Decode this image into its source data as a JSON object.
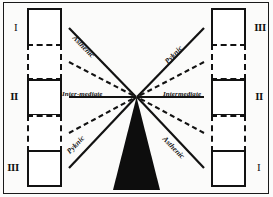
{
  "figure": {
    "colors": {
      "ink": "#121212",
      "background": "#ffffff",
      "wedge": "#0d0d0d"
    },
    "left_column": {
      "axis_label": "vertical-double-arrow",
      "nodes": [
        {
          "id": "L1",
          "numeral": "I",
          "numeral_style": "n1",
          "border": "solid",
          "arrow": "vertical-double-arrow"
        },
        {
          "id": "L2",
          "numeral": "",
          "numeral_style": "n1",
          "border": "dashed",
          "arrow": "vertical-double-arrow"
        },
        {
          "id": "L3",
          "numeral": "II",
          "numeral_style": "n2",
          "border": "solid",
          "arrow": "vertical-double-arrow"
        },
        {
          "id": "L4",
          "numeral": "",
          "numeral_style": "n1",
          "border": "dashed",
          "arrow": "vertical-double-arrow"
        },
        {
          "id": "L5",
          "numeral": "III",
          "numeral_style": "n3",
          "border": "solid",
          "arrow": "vertical-double-arrow"
        }
      ]
    },
    "right_column": {
      "axis_label": "horizontal-double-arrow",
      "nodes": [
        {
          "id": "R1",
          "numeral": "III",
          "numeral_style": "n3",
          "border": "solid",
          "arrow": "horizontal-double-arrow"
        },
        {
          "id": "R2",
          "numeral": "",
          "numeral_style": "n1",
          "border": "dashed",
          "arrow": "horizontal-double-arrow"
        },
        {
          "id": "R3",
          "numeral": "II",
          "numeral_style": "n2",
          "border": "solid",
          "arrow": "horizontal-double-arrow"
        },
        {
          "id": "R4",
          "numeral": "",
          "numeral_style": "n1",
          "border": "dashed",
          "arrow": "horizontal-double-arrow"
        },
        {
          "id": "R5",
          "numeral": "I",
          "numeral_style": "n1",
          "border": "solid",
          "arrow": "horizontal-double-arrow"
        }
      ]
    },
    "edge_labels": {
      "upper_left": "Asthenic",
      "upper_right": "Pyknic",
      "middle_left": "Inter-mediate",
      "middle_right": "Intermediate",
      "lower_left": "Pyknic",
      "lower_right": "Asthenic"
    },
    "center": {
      "wedge_name": "black-wedge",
      "convergence_point": "center-node"
    }
  }
}
